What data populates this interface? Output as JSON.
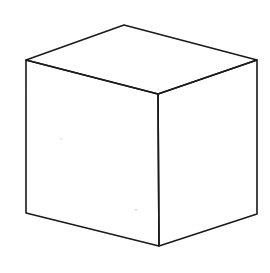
{
  "figure": {
    "width": 270,
    "height": 273,
    "colors": {
      "background": "#ffffff",
      "stroke": "#1a1a1a"
    },
    "stroke_width": 1.6,
    "vertices": {
      "top_back": [
        124,
        25
      ],
      "top_left": [
        26,
        60
      ],
      "top_right": [
        257,
        60
      ],
      "top_front": [
        158,
        94
      ],
      "bottom_left": [
        26,
        213
      ],
      "bottom_right": [
        257,
        214
      ],
      "bottom_front": [
        159,
        246
      ]
    },
    "faces": [
      {
        "name": "top-face",
        "points": "124,25 257,60 158,94 26,60"
      },
      {
        "name": "left-face",
        "points": "26,60 158,94 159,246 26,213"
      },
      {
        "name": "right-face",
        "points": "158,94 257,60 257,214 159,246"
      }
    ],
    "specks": [
      {
        "x": 61,
        "y": 139,
        "r": 0.6
      },
      {
        "x": 136,
        "y": 210,
        "r": 0.7
      }
    ]
  }
}
